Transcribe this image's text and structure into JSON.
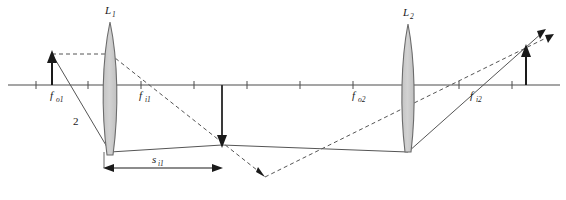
{
  "figure": {
    "kind": "two-lens-ray-diagram",
    "width": 566,
    "height": 200,
    "background_color": "#ffffff"
  },
  "colors": {
    "axis": "#4d4d4d",
    "ray_solid": "#4d4d4d",
    "ray_dashed": "#4d4d4d",
    "lens_fill": "#cccccc",
    "lens_stroke": "#666666",
    "arrow_object": "#1a1a1a",
    "label_text": "#1a1a1a"
  },
  "axis": {
    "name": "optical-axis",
    "y": 85,
    "x_start": 8,
    "x_end": 560,
    "tick_half_height": 4,
    "tick_positions": [
      88,
      141,
      194,
      247,
      300,
      353,
      406,
      459,
      512,
      36
    ]
  },
  "lenses": [
    {
      "id": "lens-1",
      "label": "L",
      "sublabel": "1",
      "center_x": 110,
      "top_y": 22,
      "bottom_y": 155,
      "half_width": 9,
      "label_x": 105,
      "label_y": 14
    },
    {
      "id": "lens-2",
      "label": "L",
      "sublabel": "2",
      "center_x": 408,
      "top_y": 24,
      "bottom_y": 152,
      "half_width": 8,
      "label_x": 403,
      "label_y": 16
    }
  ],
  "focal_labels": [
    {
      "id": "f-o1",
      "symbol": "f",
      "sub": "o1",
      "x": 50,
      "y": 99
    },
    {
      "id": "f-i1",
      "symbol": "f",
      "sub": "i1",
      "x": 139,
      "y": 99
    },
    {
      "id": "f-o2",
      "symbol": "f",
      "sub": "o2",
      "x": 352,
      "y": 99
    },
    {
      "id": "f-i2",
      "symbol": "f",
      "sub": "i2",
      "x": 470,
      "y": 99
    }
  ],
  "ray_labels": [
    {
      "id": "ray-label-2",
      "text": "2",
      "x": 75,
      "y": 124
    }
  ],
  "dimension": {
    "id": "s-i1",
    "symbol": "s",
    "sub": "i1",
    "label_x": 154,
    "label_y": 162,
    "line_y": 168,
    "x_start": 104,
    "x_end": 222,
    "guide_left_x": 104,
    "guide_left_y_top": 152,
    "guide_right_x": 222,
    "guide_right_y_top": 145
  },
  "objects": [
    {
      "id": "object-arrow",
      "name": "object-arrow",
      "direction": "up",
      "x": 52,
      "base_y": 85,
      "tip_y": 54
    },
    {
      "id": "intermediate-image-arrow",
      "name": "intermediate-image-arrow",
      "direction": "down",
      "x": 222,
      "base_y": 85,
      "tip_y": 145
    },
    {
      "id": "final-image-arrow",
      "name": "final-image-arrow",
      "direction": "up",
      "x": 526,
      "base_y": 85,
      "tip_y": 45
    }
  ],
  "rays": [
    {
      "id": "ray-parallel-top",
      "style": "dashed",
      "points": "52,54 110,54"
    },
    {
      "id": "ray-through-f-i1",
      "style": "dashed",
      "points": "110,54 265,176",
      "arrowhead": "end"
    },
    {
      "id": "ray-chief-object",
      "style": "solid",
      "points": "52,54 110,152"
    },
    {
      "id": "ray-lens1-to-image",
      "style": "solid",
      "points": "110,152 222,145"
    },
    {
      "id": "ray-image-to-lens2",
      "style": "solid",
      "points": "222,145 408,152"
    },
    {
      "id": "ray-lens2-output-solid",
      "style": "solid",
      "points": "408,152 545,30",
      "arrowhead": "end"
    },
    {
      "id": "ray-dashed-into-lens2",
      "style": "dashed",
      "points": "265,176 408,106"
    },
    {
      "id": "ray-lens2-output-dashed",
      "style": "dashed",
      "points": "408,106 553,35",
      "arrowhead": "end"
    },
    {
      "id": "ray-dashed-final-upper",
      "style": "dashed",
      "points": "490,93 526,45"
    }
  ]
}
